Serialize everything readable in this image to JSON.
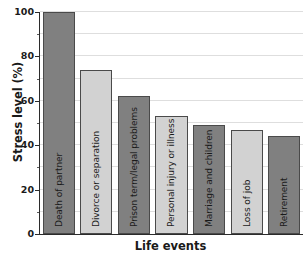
{
  "chart_data": {
    "type": "bar",
    "title": "",
    "xlabel": "Life events",
    "ylabel": "Stress level (%)",
    "ylim": [
      0,
      100
    ],
    "yticks": [
      0,
      20,
      40,
      60,
      80,
      100
    ],
    "ytick_labels": [
      "0",
      "20",
      "40",
      "60",
      "80",
      "100"
    ],
    "minor_ytick_step": 10,
    "grid": true,
    "grid_axis": "y",
    "grid_step": 10,
    "legend": false,
    "categories": [
      "Death of partner",
      "Divorce or separation",
      "Prison term/legal problems",
      "Personal injury or illness",
      "Marriage and children",
      "Loss of job",
      "Retirement"
    ],
    "values": [
      100,
      74,
      62,
      53,
      49,
      47,
      44
    ],
    "bar_colors": [
      "#808080",
      "#d2d2d2",
      "#808080",
      "#d2d2d2",
      "#808080",
      "#d2d2d2",
      "#808080"
    ],
    "bar_edge_color": "#4a4a4a",
    "labels_inside_bars": true,
    "label_rotation": 90,
    "axis_color": "#2b2b2b",
    "grid_color": "#dedede",
    "background": "#ffffff"
  }
}
